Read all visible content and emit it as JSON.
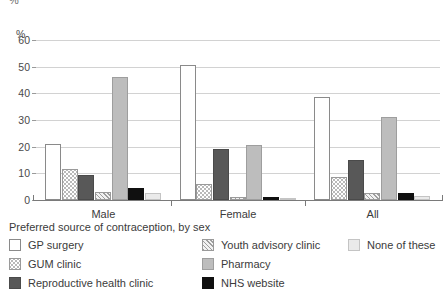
{
  "axis": {
    "unit_label": "%",
    "yticks": [
      0,
      10,
      20,
      30,
      40,
      50,
      60
    ],
    "ymin": 0,
    "ymax": 60
  },
  "legend": {
    "title": "Preferred source of contraception, by sex",
    "entries": [
      {
        "label": "GP surgery",
        "key": "gp",
        "swatch": "white-outline"
      },
      {
        "label": "GUM clinic",
        "key": "gum",
        "swatch": "dotted"
      },
      {
        "label": "Reproductive health clinic",
        "key": "rhc",
        "swatch": "dark-gray"
      },
      {
        "label": "Youth advisory clinic",
        "key": "yac",
        "swatch": "diagonal-hatch"
      },
      {
        "label": "Pharmacy",
        "key": "pharm",
        "swatch": "medium-gray"
      },
      {
        "label": "NHS website",
        "key": "nhs",
        "swatch": "black"
      },
      {
        "label": "None of these",
        "key": "none",
        "swatch": "light-gray"
      }
    ]
  },
  "chart_data": {
    "type": "bar",
    "title": "Preferred source of contraception, by sex",
    "xlabel": "",
    "ylabel": "%",
    "ylim": [
      0,
      60
    ],
    "yticks": [
      0,
      10,
      20,
      30,
      40,
      50,
      60
    ],
    "grid": true,
    "legend_position": "bottom",
    "categories": [
      "Male",
      "Female",
      "All"
    ],
    "series": [
      {
        "name": "GP surgery",
        "values": [
          21.0,
          50.5,
          38.5
        ]
      },
      {
        "name": "GUM clinic",
        "values": [
          11.5,
          6.0,
          8.5
        ]
      },
      {
        "name": "Reproductive health clinic",
        "values": [
          9.5,
          19.0,
          15.0
        ]
      },
      {
        "name": "Youth advisory clinic",
        "values": [
          3.0,
          1.0,
          2.5
        ]
      },
      {
        "name": "Pharmacy",
        "values": [
          46.0,
          20.5,
          31.0
        ]
      },
      {
        "name": "NHS website",
        "values": [
          4.5,
          1.0,
          2.5
        ]
      },
      {
        "name": "None of these",
        "values": [
          2.5,
          0.5,
          1.5
        ]
      }
    ]
  }
}
